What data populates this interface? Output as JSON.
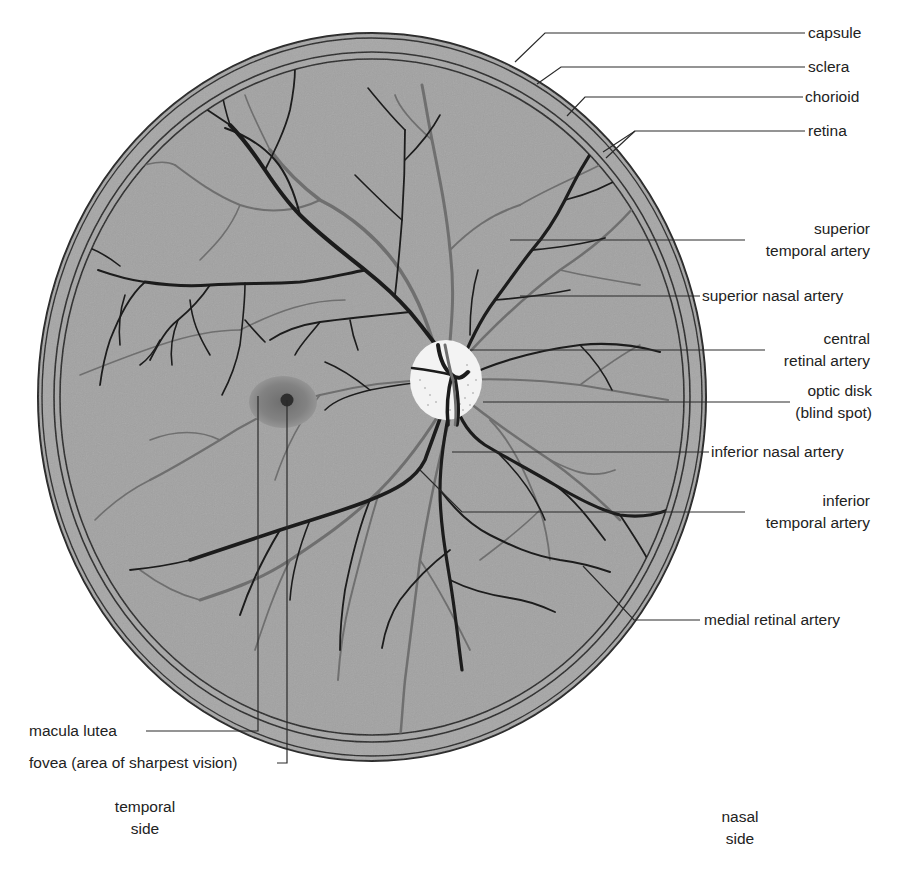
{
  "caption": "as seen through an ophthalmoscope.",
  "colors": {
    "fundus": "#a3a3a3",
    "outline": "#2a2a2a",
    "artery": "#1c1c1c",
    "vein": "#6f6f6f",
    "optic_disk": "#f4f4f4",
    "macula": "#7c7c7c",
    "fovea": "#2e2e2e"
  },
  "labels": {
    "capsule": "capsule",
    "sclera": "sclera",
    "chorioid": "chorioid",
    "retina": "retina",
    "superior_temporal_artery": [
      "superior",
      "temporal artery"
    ],
    "superior_nasal_artery": "superior nasal artery",
    "central_retinal_artery": [
      "central",
      "retinal artery"
    ],
    "optic_disk": [
      "optic disk",
      "(blind spot)"
    ],
    "inferior_nasal_artery": "inferior nasal artery",
    "inferior_temporal_artery": [
      "inferior",
      "temporal artery"
    ],
    "medial_retinal_artery": "medial retinal artery",
    "macula_lutea": "macula lutea",
    "fovea": "fovea (area of sharpest vision)",
    "temporal_side": [
      "temporal",
      "side"
    ],
    "nasal_side": [
      "nasal",
      "side"
    ]
  }
}
